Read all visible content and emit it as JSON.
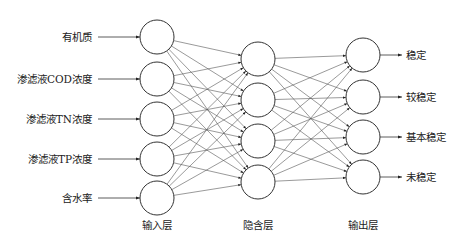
{
  "title": "",
  "layers": {
    "input": {
      "label": "输入层",
      "cx": 157,
      "nodes": [
        {
          "label": "有机质",
          "cy": 37
        },
        {
          "label": "渗滤液COD浓度",
          "cy": 79
        },
        {
          "label": "渗滤液TN浓度",
          "cy": 119
        },
        {
          "label": "渗滤液TP浓度",
          "cy": 159
        },
        {
          "label": "含水率",
          "cy": 198
        }
      ]
    },
    "hidden": {
      "label": "隐含层",
      "cx": 258,
      "nodes": [
        {
          "cy": 59
        },
        {
          "cy": 100
        },
        {
          "cy": 141
        },
        {
          "cy": 182
        }
      ]
    },
    "output": {
      "label": "输出层",
      "cx": 363,
      "nodes": [
        {
          "label": "稳定",
          "cy": 55
        },
        {
          "label": "较稳定",
          "cy": 97
        },
        {
          "label": "基本稳定",
          "cy": 137
        },
        {
          "label": "未稳定",
          "cy": 177
        }
      ]
    }
  },
  "node_radius": 17,
  "layer_label_y": 229,
  "colors": {
    "stroke": "#333333",
    "edge": "#555555",
    "text": "#222222"
  }
}
